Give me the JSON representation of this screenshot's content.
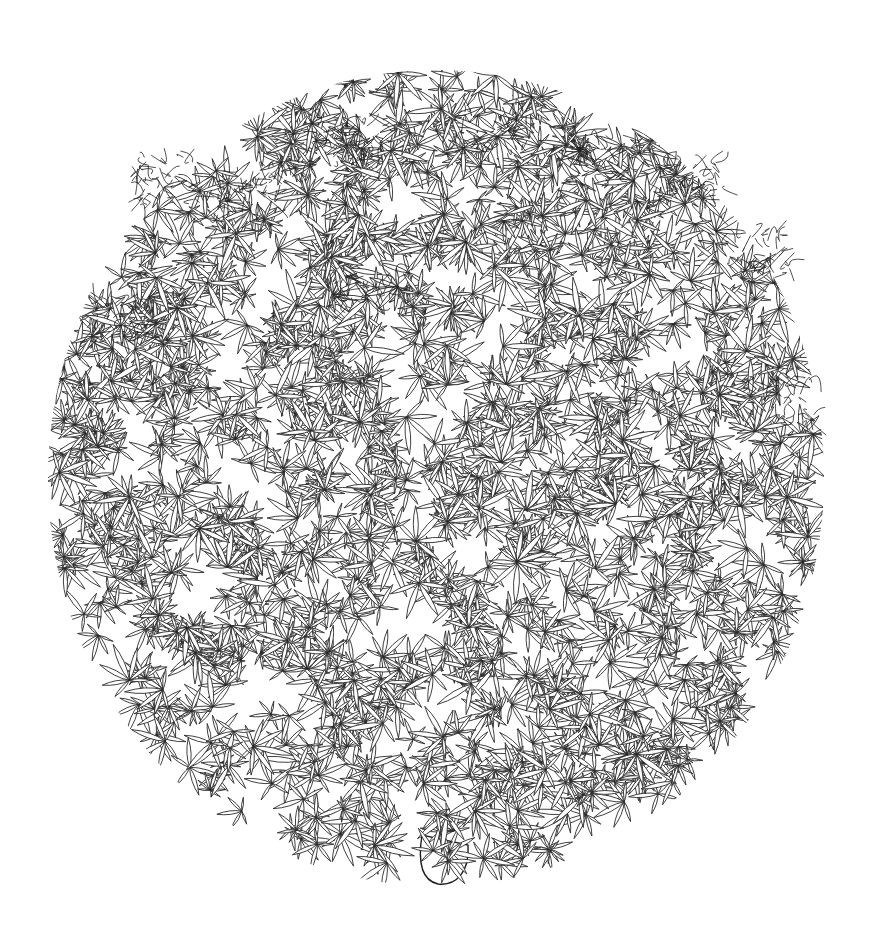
{
  "illustration": {
    "subject": "line drawing of a cannabis plant pruned into a sphere",
    "colors": {
      "background": "#ffffff",
      "line": "#2a2a2a"
    },
    "sphere": {
      "cx": 436,
      "cy": 470,
      "rx": 385,
      "ry": 400
    },
    "trunk": {
      "x": 440,
      "bottom_y": 885
    },
    "bud_clusters": [
      {
        "x": 165,
        "y": 180
      },
      {
        "x": 250,
        "y": 190
      },
      {
        "x": 350,
        "y": 140
      },
      {
        "x": 490,
        "y": 130
      },
      {
        "x": 600,
        "y": 160
      },
      {
        "x": 690,
        "y": 185
      },
      {
        "x": 760,
        "y": 250
      },
      {
        "x": 370,
        "y": 290
      },
      {
        "x": 115,
        "y": 320
      },
      {
        "x": 780,
        "y": 400
      }
    ]
  }
}
